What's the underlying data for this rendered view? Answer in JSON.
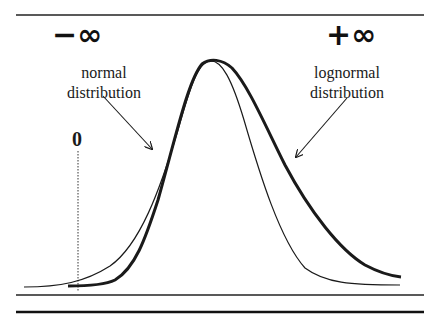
{
  "diagram": {
    "labels": {
      "neg_infinity": "−∞",
      "pos_infinity": "+∞",
      "normal_line1": "normal",
      "normal_line2": "distribution",
      "lognormal_line1": "lognormal",
      "lognormal_line2": "distribution",
      "zero": "0"
    },
    "curves": [
      {
        "name": "normal distribution",
        "style": "thin",
        "description": "symmetric bell curve extending left past zero toward −∞"
      },
      {
        "name": "lognormal distribution",
        "style": "thick",
        "description": "right-skewed curve starting at zero with a longer right tail toward +∞"
      }
    ],
    "colors": {
      "ink": "#1a1a1a",
      "background": "#ffffff"
    }
  }
}
